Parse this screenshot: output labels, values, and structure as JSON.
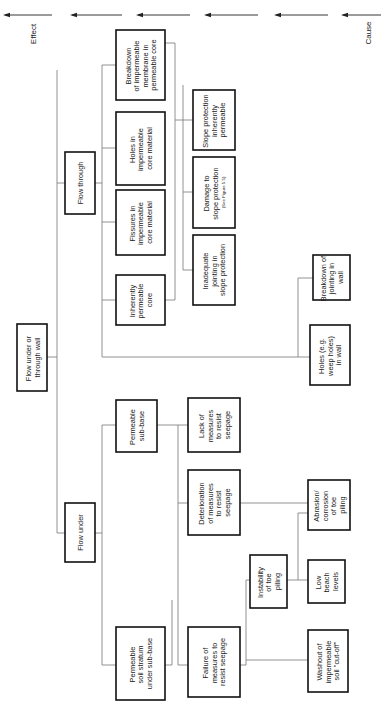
{
  "axis": {
    "effect_label": "Effect",
    "cause_label": "Cause",
    "arrow_direction": "cause-to-effect",
    "arrow_count": 6
  },
  "nodes": {
    "root": {
      "lines": [
        "Flow under or",
        "through wall"
      ]
    },
    "flow_through": {
      "lines": [
        "Flow through"
      ]
    },
    "flow_under": {
      "lines": [
        "Flow under"
      ]
    },
    "breakdown_membrane": {
      "lines": [
        "Breakdown",
        "of impermeable",
        "membrane in",
        "permeable core"
      ]
    },
    "holes_core": {
      "lines": [
        "Holes in",
        "impermeable",
        "core material"
      ]
    },
    "fissures_core": {
      "lines": [
        "Fissures in",
        "impermeable",
        "core material"
      ]
    },
    "inherently_permeable_core": {
      "lines": [
        "Inherently",
        "permeable",
        "core"
      ]
    },
    "slope_permeable": {
      "lines": [
        "Slope protection",
        "inherently",
        "permeable"
      ]
    },
    "damage_slope": {
      "lines": [
        "Damage to",
        "slope protection"
      ],
      "note": "(See Figure 5.5)"
    },
    "inadequate_jointing": {
      "lines": [
        "Inadequate",
        "jointing in",
        "slope protection"
      ]
    },
    "breakdown_jointing_wall": {
      "lines": [
        "Breakdown of",
        "jointing in",
        "wall"
      ]
    },
    "holes_wall": {
      "lines": [
        "Holes (e.g.",
        "weep holes)",
        "in wall"
      ]
    },
    "permeable_subbase": {
      "lines": [
        "Permeable",
        "sub-base"
      ]
    },
    "lack_measures": {
      "lines": [
        "Lack of",
        "measures",
        "to resist",
        "seepage"
      ]
    },
    "deterioration_measures": {
      "lines": [
        "Deterioration",
        "of measures",
        "to resist",
        "seepage"
      ]
    },
    "permeable_soil": {
      "lines": [
        "Permeable",
        "soil stratum",
        "under sub-base"
      ]
    },
    "failure_measures": {
      "lines": [
        "Failure of",
        "measures to",
        "resist seepage"
      ]
    },
    "instability_toe": {
      "lines": [
        "Instability",
        "of toe",
        "piling"
      ]
    },
    "abrasion_toe": {
      "lines": [
        "Abrasion/",
        "corrosion",
        "of toe",
        "piling"
      ]
    },
    "low_beach": {
      "lines": [
        "Low",
        "beach",
        "levels"
      ]
    },
    "washout": {
      "lines": [
        "Washout of",
        "impermeable",
        "soil \"cut-off\""
      ]
    }
  }
}
